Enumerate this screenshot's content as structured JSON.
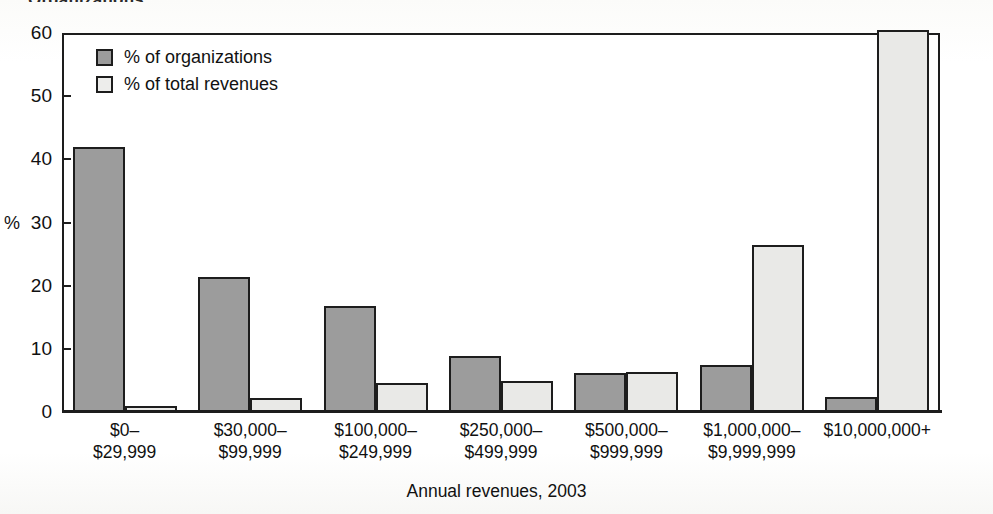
{
  "figure": {
    "cut_off_title": "Organizations",
    "axis_pct_label": "%",
    "xaxis_title": "Annual revenues, 2003"
  },
  "legend": {
    "entries": [
      {
        "label": "% of organizations",
        "swatch": "dark-swatch-icon",
        "color": "#9c9c9c"
      },
      {
        "label": "% of total revenues",
        "swatch": "light-swatch-icon",
        "color": "#ededeb"
      }
    ]
  },
  "yaxis": {
    "ticks": [
      "0",
      "10",
      "20",
      "30",
      "40",
      "50",
      "60"
    ]
  },
  "chart_data": {
    "type": "bar",
    "title": "Organizations",
    "xlabel": "Annual revenues, 2003",
    "ylabel": "%",
    "ylim": [
      0,
      60
    ],
    "yticks": [
      0,
      10,
      20,
      30,
      40,
      50,
      60
    ],
    "grid": false,
    "legend_position": "top-left-inside",
    "categories": [
      "$0–$29,999",
      "$30,000–$99,999",
      "$100,000–$249,999",
      "$250,000–$499,999",
      "$500,000–$999,999",
      "$1,000,000–$9,999,999",
      "$10,000,000+"
    ],
    "category_lines": [
      [
        "$0–",
        "$29,999"
      ],
      [
        "$30,000–",
        "$99,999"
      ],
      [
        "$100,000–",
        "$249,999"
      ],
      [
        "$250,000–",
        "$499,999"
      ],
      [
        "$500,000–",
        "$999,999"
      ],
      [
        "$1,000,000–",
        "$9,999,999"
      ],
      [
        "$10,000,000+",
        ""
      ]
    ],
    "series": [
      {
        "name": "% of organizations",
        "color": "#9c9c9c",
        "values": [
          42.0,
          21.3,
          16.8,
          8.9,
          6.1,
          7.5,
          2.4
        ]
      },
      {
        "name": "% of total revenues",
        "color": "#e9e9e7",
        "values": [
          1.0,
          2.2,
          4.6,
          4.9,
          6.3,
          26.4,
          60.5
        ]
      }
    ]
  }
}
